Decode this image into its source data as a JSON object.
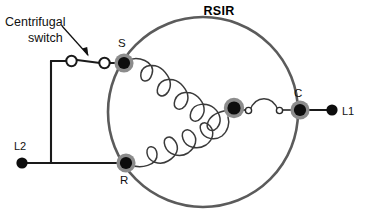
{
  "title": "RSIR",
  "annotation": {
    "line1": "Centrifugal",
    "line2": "switch"
  },
  "terminals": {
    "start": "S",
    "run": "R",
    "common": "C",
    "line1": "L1",
    "line2": "L2"
  },
  "colors": {
    "wire": "#1a1a1a",
    "motor_circle": "#5b5b5b",
    "node_core": "#0d0d0d",
    "node_ring": "#8c8c8c",
    "coil": "#3a3a3a",
    "background": "#ffffff",
    "text": "#111111"
  },
  "geometry": {
    "motor_center_x": 203,
    "motor_center_y": 112,
    "motor_radius": 95
  }
}
